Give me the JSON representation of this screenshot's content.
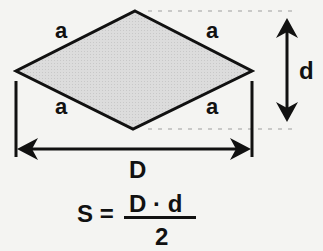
{
  "diagram": {
    "shape": "rhombus",
    "fill_color": "#d6d6d6",
    "stroke_color": "#111111",
    "vertices": {
      "top": [
        135,
        11
      ],
      "right": [
        252,
        71
      ],
      "bottom": [
        133,
        129
      ],
      "left": [
        16,
        71
      ]
    },
    "side_labels": [
      "a",
      "a",
      "a",
      "a"
    ],
    "long_diagonal_label": "D",
    "short_diagonal_label": "d",
    "formula": {
      "lhs": "S =",
      "numerator": "D · d",
      "denominator": "2"
    }
  }
}
